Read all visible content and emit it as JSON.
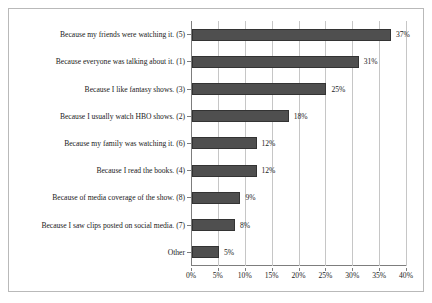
{
  "chart_data": {
    "type": "bar",
    "orientation": "horizontal",
    "title": "",
    "xlabel": "",
    "ylabel": "",
    "xlim": [
      0,
      40
    ],
    "xticks": [
      "0%",
      "5%",
      "10%",
      "15%",
      "20%",
      "25%",
      "30%",
      "35%",
      "40%"
    ],
    "xtick_values": [
      0,
      5,
      10,
      15,
      20,
      25,
      30,
      35,
      40
    ],
    "grid": "vertical",
    "legend": "none",
    "bar_color": "#4f4f4f",
    "categories": [
      "Because my friends were watching it. (5)",
      "Because everyone was talking about it. (1)",
      "Because I like fantasy shows. (3)",
      "Because I usually watch HBO shows. (2)",
      "Because my family was watching it. (6)",
      "Because I read the books. (4)",
      "Because of media coverage of the show. (8)",
      "Because I saw clips posted on social media. (7)",
      "Other"
    ],
    "values": [
      37,
      31,
      25,
      18,
      12,
      12,
      9,
      8,
      5
    ],
    "data_labels": [
      "37%",
      "31%",
      "25%",
      "18%",
      "12%",
      "12%",
      "9%",
      "8%",
      "5%"
    ]
  }
}
